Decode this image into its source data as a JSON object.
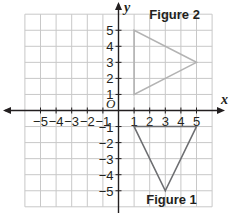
{
  "chart_data": {
    "type": "scatter",
    "title": "",
    "xlabel": "x",
    "ylabel": "y",
    "xlim": [
      -6,
      6
    ],
    "ylim": [
      -6,
      6
    ],
    "grid": true,
    "origin_label": "O",
    "x_ticks": [
      -5,
      -4,
      -3,
      -2,
      -1,
      1,
      2,
      3,
      4,
      5
    ],
    "y_ticks": [
      -5,
      -4,
      -3,
      -2,
      -1,
      1,
      2,
      3,
      4,
      5
    ],
    "x_tick_labels": [
      "−5",
      "−4",
      "−3",
      "−2",
      "−1",
      "1",
      "2",
      "3",
      "4",
      "5"
    ],
    "y_tick_labels": [
      "−5",
      "−4",
      "−3",
      "−2",
      "−1",
      "1",
      "2",
      "3",
      "4",
      "5"
    ],
    "series": [
      {
        "name": "Figure 1",
        "shape": "triangle",
        "vertices": [
          [
            1,
            -1
          ],
          [
            5,
            -1
          ],
          [
            3,
            -5
          ]
        ],
        "label_position": [
          3.4,
          -5.8
        ],
        "color": "#6d6e71"
      },
      {
        "name": "Figure 2",
        "shape": "triangle",
        "vertices": [
          [
            1,
            5
          ],
          [
            1,
            1
          ],
          [
            5,
            3
          ]
        ],
        "label_position": [
          3.6,
          5.7
        ],
        "color": "#b3b3b3"
      }
    ]
  },
  "colors": {
    "grid": "#c8c8c8",
    "axis": "#231f20",
    "figure1": "#6d6e71",
    "figure2": "#b3b3b3"
  }
}
